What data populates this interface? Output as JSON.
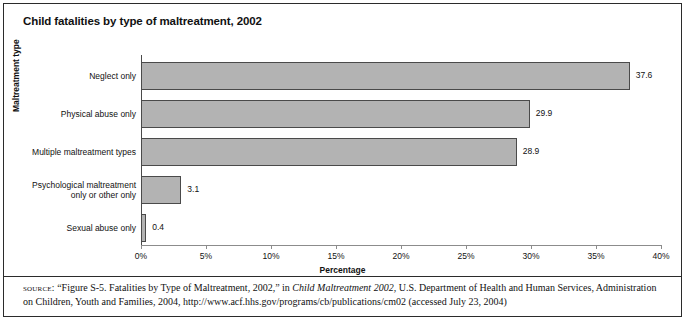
{
  "figure": {
    "title": "Child fatalities by type of maltreatment, 2002",
    "source_label": "source:",
    "source_part1": " “Figure S-5. Fatalities by Type of Maltreatment, 2002,” in ",
    "source_italic": "Child Maltreatment 2002",
    "source_part2": ", U.S. Department of Health and Human Services, Administration on Children, Youth and Families, 2004, http://www.acf.hhs.gov/programs/cb/publications/cm02 (accessed July 23, 2004)"
  },
  "chart_data": {
    "type": "bar",
    "orientation": "horizontal",
    "title": "Child fatalities by type of maltreatment, 2002",
    "xlabel": "Percentage",
    "ylabel": "Maltreatment type",
    "categories": [
      "Neglect only",
      "Physical abuse only",
      "Multiple maltreatment types",
      "Psychological maltreatment only or other only",
      "Sexual abuse only"
    ],
    "values": [
      37.6,
      29.9,
      28.9,
      3.1,
      0.4
    ],
    "value_labels": [
      "37.6",
      "29.9",
      "28.9",
      "3.1",
      "0.4"
    ],
    "xlim": [
      0,
      40
    ],
    "xticks": [
      0,
      5,
      10,
      15,
      20,
      25,
      30,
      35,
      40
    ],
    "xtick_labels": [
      "0%",
      "5%",
      "10%",
      "15%",
      "20%",
      "25%",
      "30%",
      "35%",
      "40%"
    ],
    "grid": false,
    "legend": false,
    "bar_color": "#b3b3b3",
    "bar_edge_color": "#4a4a4a"
  }
}
